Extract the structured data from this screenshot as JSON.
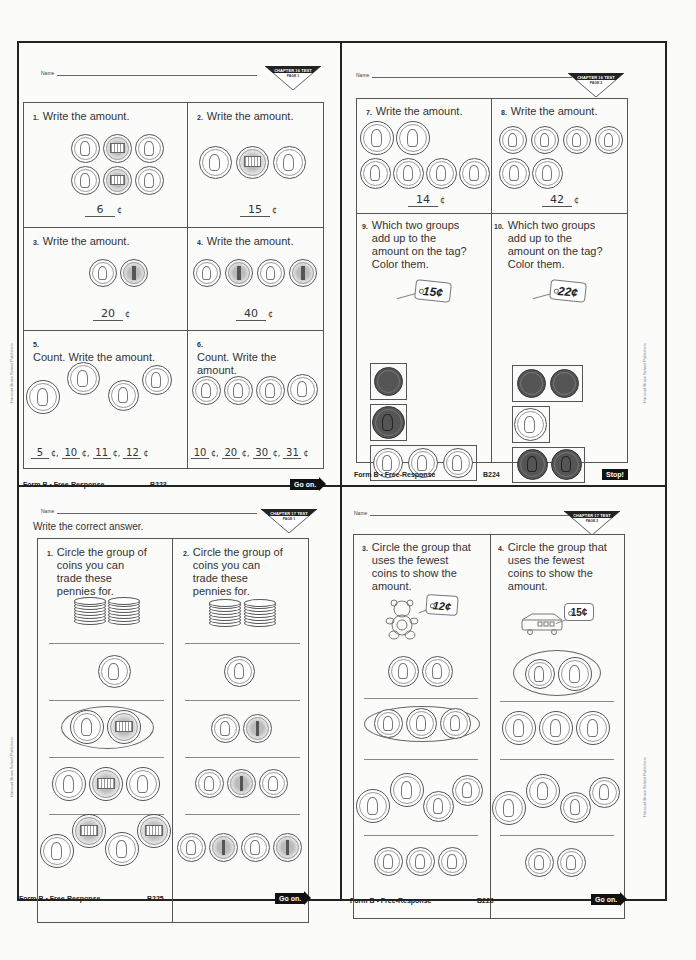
{
  "pages": [
    {
      "name_label": "Name",
      "badge": {
        "line1": "CHAPTER 16 TEST",
        "line2": "PAGE 1"
      },
      "questions": [
        {
          "num": "1.",
          "text": "Write the amount.",
          "answer": "6",
          "unit": "¢"
        },
        {
          "num": "2.",
          "text": "Write the amount.",
          "answer": "15",
          "unit": "¢"
        },
        {
          "num": "3.",
          "text": "Write the amount.",
          "answer": "20",
          "unit": "¢"
        },
        {
          "num": "4.",
          "text": "Write the amount.",
          "answer": "40",
          "unit": "¢"
        },
        {
          "num": "5.",
          "text": "Count. Write the amount.",
          "answers": [
            "5",
            "10",
            "11",
            "12"
          ],
          "unit": "¢"
        },
        {
          "num": "6.",
          "text": "Count. Write the amount.",
          "answers": [
            "10",
            "20",
            "30",
            "31"
          ],
          "unit": "¢"
        }
      ],
      "footer": {
        "form": "Form B • Free-Response",
        "page_code": "B223",
        "nav": "Go on."
      },
      "side_text": "Harcourt Brace School Publishers"
    },
    {
      "name_label": "Name",
      "badge": {
        "line1": "CHAPTER 16 TEST",
        "line2": "PAGE 2"
      },
      "questions": [
        {
          "num": "7.",
          "text": "Write the amount.",
          "answer": "14",
          "unit": "¢"
        },
        {
          "num": "8.",
          "text": "Write the amount.",
          "answer": "42",
          "unit": "¢"
        },
        {
          "num": "9.",
          "text": "Which two groups add up to the amount on the tag? Color them.",
          "tag": "15¢"
        },
        {
          "num": "10.",
          "text": "Which two groups add up to the amount on the tag? Color them.",
          "tag": "22¢"
        }
      ],
      "footer": {
        "form": "Form B • Free-Response",
        "page_code": "B224",
        "nav": "Stop!"
      },
      "side_text": "Harcourt Brace School Publishers"
    },
    {
      "name_label": "Name",
      "instruction": "Write the correct answer.",
      "badge": {
        "line1": "CHAPTER 17 TEST",
        "line2": "PAGE 1"
      },
      "questions": [
        {
          "num": "1.",
          "text": "Circle the group of coins you can trade these pennies for."
        },
        {
          "num": "2.",
          "text": "Circle the group of coins you can trade these pennies for."
        }
      ],
      "footer": {
        "form": "Form B • Free-Response",
        "page_code": "B225",
        "nav": "Go on."
      },
      "side_text": "Harcourt Brace School Publishers"
    },
    {
      "name_label": "Name",
      "badge": {
        "line1": "CHAPTER 17 TEST",
        "line2": "PAGE 2"
      },
      "questions": [
        {
          "num": "3.",
          "text": "Circle the group that uses the fewest coins to show the amount.",
          "tag": "12¢"
        },
        {
          "num": "4.",
          "text": "Circle the group that uses the fewest coins to show the amount.",
          "tag": "15¢"
        }
      ],
      "footer": {
        "form": "Form B • Free-Response",
        "page_code": "B226",
        "nav": "Go on."
      },
      "side_text": "Harcourt Brace School Publishers"
    }
  ],
  "colors": {
    "ink": "#222222",
    "paper": "#fbfbfa",
    "nav_bg": "#111111"
  }
}
